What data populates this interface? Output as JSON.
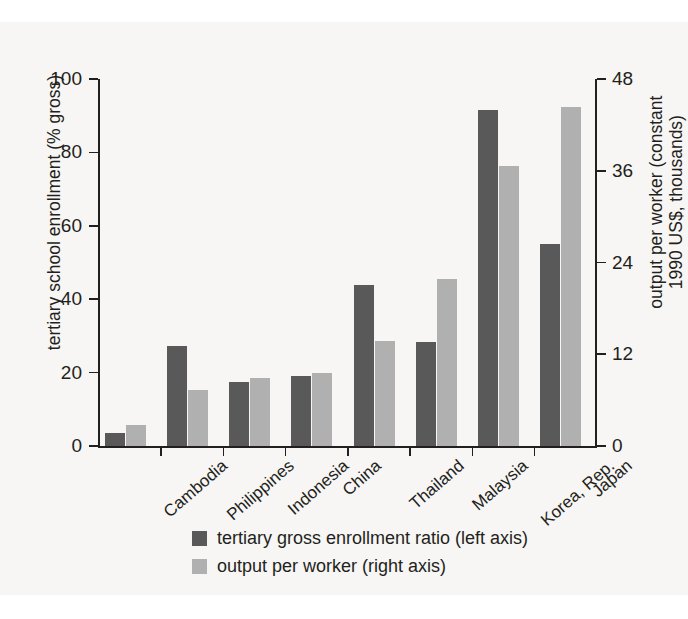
{
  "chart_data": {
    "type": "bar",
    "title": "",
    "subtitle": "",
    "categories": [
      "Cambodia",
      "Philippines",
      "Indonesia",
      "China",
      "Thailand",
      "Malaysia",
      "Korea, Rep.",
      "Japan"
    ],
    "series": [
      {
        "name": "tertiary gross enrollment ratio (left axis)",
        "axis": "left",
        "color": "#595959",
        "values": [
          3.5,
          27.3,
          17.5,
          19.2,
          43.8,
          28.3,
          91.5,
          55.0
        ]
      },
      {
        "name": "output per worker (right axis)",
        "axis": "right",
        "color": "#b0b0b0",
        "values": [
          2.7,
          7.3,
          8.9,
          9.5,
          13.8,
          21.9,
          36.6,
          44.3
        ]
      }
    ],
    "xlabel": "",
    "ylabel": "tertiary school enrollment (% gross)",
    "y2label_line1": "output per worker (constant",
    "y2label_line2": "1990 US$, thousands)",
    "ylim": [
      0,
      100
    ],
    "y2lim": [
      0,
      48
    ],
    "yticks": [
      0,
      20,
      40,
      60,
      80,
      100
    ],
    "y2ticks": [
      0,
      12,
      24,
      36,
      48
    ],
    "ytick_labels": [
      "0",
      "20",
      "40",
      "60",
      "80",
      "100"
    ],
    "y2tick_labels": [
      "0",
      "12",
      "24",
      "36",
      "48"
    ],
    "grid": false,
    "legend_position": "bottom-center",
    "legend": [
      {
        "label": "tertiary gross enrollment ratio (left axis)",
        "color": "#595959"
      },
      {
        "label": "output per worker (right axis)",
        "color": "#b0b0b0"
      }
    ]
  },
  "colors": {
    "bar_dark": "#595959",
    "bar_light": "#b0b0b0",
    "axis": "#231f20",
    "panel_background": "#f7f6f4",
    "page_background": "#ffffff"
  }
}
